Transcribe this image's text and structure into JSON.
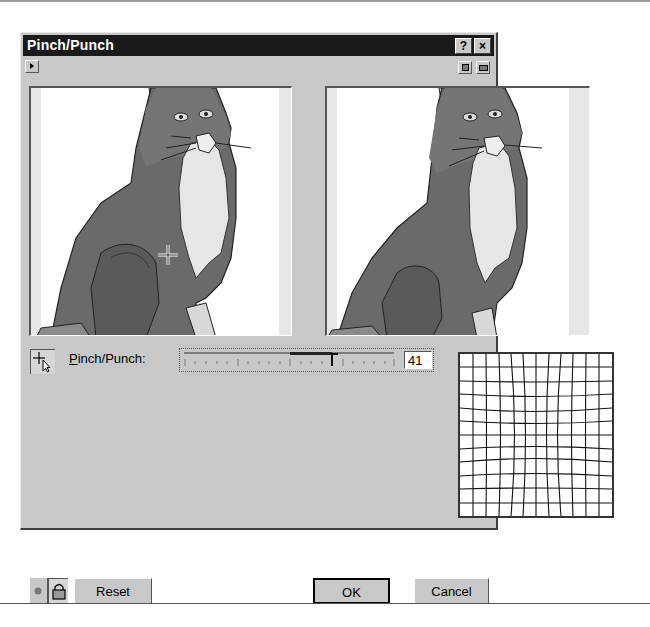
{
  "dialog": {
    "title": "Pinch/Punch",
    "title_buttons": {
      "help": "?",
      "close": "×"
    }
  },
  "toolbar": {
    "preview_toggle_icon": "play-triangle-icon",
    "view_buttons": [
      "single-preview-icon",
      "dual-preview-icon"
    ]
  },
  "previews": {
    "left": {
      "role": "original",
      "cursor": "crosshair"
    },
    "right": {
      "role": "result"
    }
  },
  "controls": {
    "tool_icon": "crosshair-pointer-icon",
    "slider_label_mnemonic": "P",
    "slider_label_rest": "inch/Punch:",
    "slider_value": "41",
    "slider_min": -100,
    "slider_max": 100
  },
  "grid_preview": {
    "type": "pinch-distortion-grid",
    "cells": 12
  },
  "buttons": {
    "preview_eye": "eye-icon",
    "lock": "lock-icon",
    "reset": "Reset",
    "ok": "OK",
    "cancel": "Cancel",
    "help": "Help"
  },
  "colors": {
    "dialog_bg": "#c8c8c8",
    "titlebar_bg": "#1a1a1a",
    "cat_body": "#6a6a6a",
    "cat_chest": "#e8e8e8"
  }
}
